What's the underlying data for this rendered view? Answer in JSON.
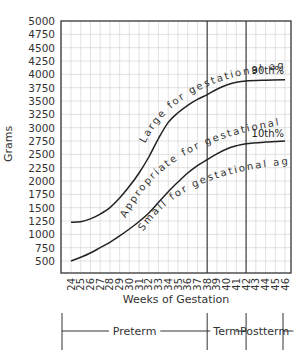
{
  "chart_data": {
    "type": "line",
    "title": "",
    "xlabel": "Weeks of Gestation",
    "ylabel": "Grams",
    "xlim": [
      24,
      46
    ],
    "ylim": [
      500,
      5000
    ],
    "x_ticks": [
      24,
      25,
      26,
      27,
      28,
      29,
      30,
      31,
      32,
      33,
      34,
      35,
      36,
      37,
      38,
      39,
      40,
      41,
      42,
      43,
      44,
      45,
      46
    ],
    "y_ticks": [
      500,
      750,
      1000,
      1250,
      1500,
      1750,
      2000,
      2250,
      2500,
      2750,
      3000,
      3250,
      3500,
      3750,
      4000,
      4250,
      4500,
      4750,
      5000
    ],
    "grid": true,
    "series": [
      {
        "name": "90th%",
        "x": [
          24,
          25,
          26,
          27,
          28,
          29,
          30,
          31,
          32,
          33,
          34,
          35,
          36,
          37,
          38,
          39,
          40,
          41,
          42,
          44,
          46
        ],
        "values": [
          1225,
          1235,
          1290,
          1380,
          1500,
          1680,
          1900,
          2150,
          2450,
          2800,
          3100,
          3280,
          3420,
          3530,
          3620,
          3720,
          3800,
          3850,
          3875,
          3890,
          3900
        ]
      },
      {
        "name": "10th%",
        "x": [
          24,
          25,
          26,
          27,
          28,
          29,
          30,
          31,
          32,
          33,
          34,
          35,
          36,
          37,
          38,
          39,
          40,
          41,
          42,
          44,
          46
        ],
        "values": [
          500,
          570,
          650,
          750,
          850,
          970,
          1100,
          1240,
          1400,
          1600,
          1800,
          1980,
          2150,
          2290,
          2400,
          2510,
          2600,
          2660,
          2700,
          2730,
          2750
        ]
      }
    ],
    "annotations": [
      "Large for gestational age",
      "Appropriate for gestational age",
      "Small for gestational age",
      "90th%",
      "10th%"
    ],
    "vertical_markers": [
      38,
      42
    ],
    "periods": [
      {
        "label": "Preterm",
        "from": 24,
        "to": 38
      },
      {
        "label": "Term",
        "from": 38,
        "to": 42
      },
      {
        "label": "Postterm",
        "from": 42,
        "to": 46
      }
    ]
  }
}
